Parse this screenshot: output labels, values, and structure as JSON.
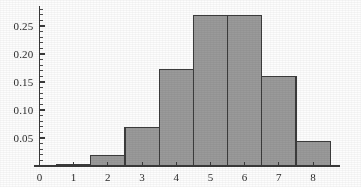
{
  "chart_data": {
    "type": "bar",
    "title": "",
    "subtitle": "",
    "xlabel": "",
    "ylabel": "",
    "grid": false,
    "legend": null,
    "xlim": [
      -0.6,
      8.8
    ],
    "ylim": [
      0,
      0.285
    ],
    "bin_width": 1,
    "bin_edges": [
      0.5,
      1.5,
      2.5,
      3.5,
      4.5,
      5.5,
      6.5,
      7.5,
      8.5
    ],
    "categories": [
      "1",
      "2",
      "3",
      "4",
      "5",
      "6",
      "7",
      "8"
    ],
    "values": [
      0.003,
      0.018,
      0.068,
      0.172,
      0.268,
      0.268,
      0.16,
      0.043
    ],
    "bars": [
      {
        "left": 0.5,
        "right": 1.5,
        "center": 1,
        "height": 0.003
      },
      {
        "left": 1.5,
        "right": 2.5,
        "center": 2,
        "height": 0.018
      },
      {
        "left": 2.5,
        "right": 3.5,
        "center": 3,
        "height": 0.068
      },
      {
        "left": 3.5,
        "right": 4.5,
        "center": 4,
        "height": 0.172
      },
      {
        "left": 4.5,
        "right": 5.5,
        "center": 5,
        "height": 0.268
      },
      {
        "left": 5.5,
        "right": 6.5,
        "center": 6,
        "height": 0.268
      },
      {
        "left": 6.5,
        "right": 7.5,
        "center": 7,
        "height": 0.16
      },
      {
        "left": 7.5,
        "right": 8.5,
        "center": 8,
        "height": 0.043
      }
    ],
    "xticks": [
      0,
      1,
      2,
      3,
      4,
      5,
      6,
      7,
      8
    ],
    "xtick_labels": [
      "0",
      "1",
      "2",
      "3",
      "4",
      "5",
      "6",
      "7",
      "8"
    ],
    "yticks": [
      0.05,
      0.1,
      0.15,
      0.2,
      0.25
    ],
    "ytick_labels": [
      "0.05",
      "0.10",
      "0.15",
      "0.20",
      "0.25"
    ],
    "y_minor_step": 0.01,
    "colors": {
      "bar_fill": "#9a9a9a",
      "bar_edge": "#3c3c3c",
      "axis": "#3a3a3a",
      "tick_label": "#2b2b2b",
      "background": "#fdfdfd"
    }
  }
}
